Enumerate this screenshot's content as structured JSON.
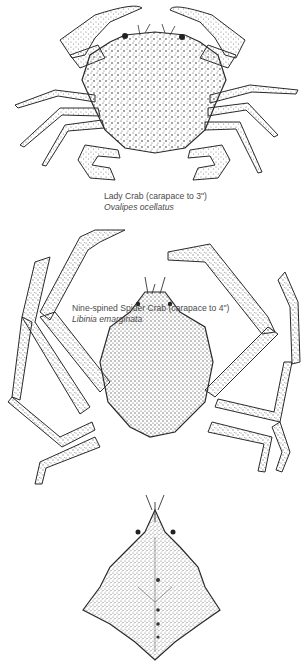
{
  "plate": {
    "figures": [
      {
        "id": "lady-crab",
        "common_name": "Lady Crab (carapace to 3\")",
        "latin_name": "Ovalipes ocellatus",
        "view": "dorsal, full body"
      },
      {
        "id": "spider-crab",
        "common_name": "Nine-spined Spider Crab (carapace to 4\")",
        "latin_name": "Libinia emarginata",
        "view": "dorsal, full body"
      },
      {
        "id": "spider-crab-carapace",
        "view": "carapace detail"
      }
    ],
    "colors": {
      "background": "#ffffff",
      "ink": "#2a2a2a",
      "text": "#4a4a4a"
    }
  }
}
